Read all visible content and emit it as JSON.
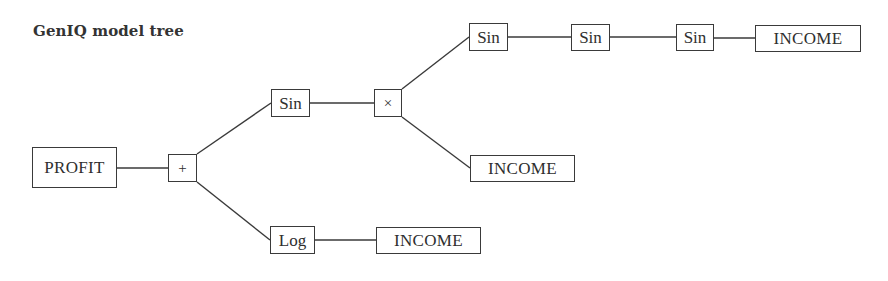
{
  "title": "GenIQ model tree",
  "colors": {
    "line": "#3a3a3a",
    "text": "#2e2e2e",
    "background": "#ffffff"
  },
  "nodes": {
    "root": {
      "label": "PROFIT",
      "type": "variable"
    },
    "plus": {
      "label": "+",
      "type": "operator"
    },
    "sin_mid": {
      "label": "Sin",
      "type": "function"
    },
    "times": {
      "label": "×",
      "type": "operator"
    },
    "sin_top_1": {
      "label": "Sin",
      "type": "function"
    },
    "sin_top_2": {
      "label": "Sin",
      "type": "function"
    },
    "sin_top_3": {
      "label": "Sin",
      "type": "function"
    },
    "income_top": {
      "label": "INCOME",
      "type": "variable"
    },
    "income_mid": {
      "label": "INCOME",
      "type": "variable"
    },
    "log": {
      "label": "Log",
      "type": "function"
    },
    "income_bottom": {
      "label": "INCOME",
      "type": "variable"
    }
  },
  "edges": [
    [
      "root",
      "plus"
    ],
    [
      "plus",
      "sin_mid"
    ],
    [
      "plus",
      "log"
    ],
    [
      "sin_mid",
      "times"
    ],
    [
      "times",
      "sin_top_1"
    ],
    [
      "times",
      "income_mid"
    ],
    [
      "sin_top_1",
      "sin_top_2"
    ],
    [
      "sin_top_2",
      "sin_top_3"
    ],
    [
      "sin_top_3",
      "income_top"
    ],
    [
      "log",
      "income_bottom"
    ]
  ]
}
